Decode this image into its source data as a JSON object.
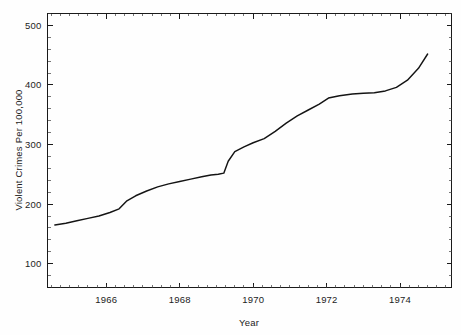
{
  "chart_data": {
    "type": "line",
    "title": "",
    "xlabel": "Year",
    "ylabel": "Violent Crimes Per 100,000",
    "xlim": [
      1964.4,
      1975.4
    ],
    "ylim": [
      60,
      520
    ],
    "grid": false,
    "legend": "none",
    "xticks": [
      1966,
      1968,
      1970,
      1972,
      1974
    ],
    "xtick_labels": [
      "1966",
      "1968",
      "1970",
      "1972",
      "1974"
    ],
    "yticks": [
      100,
      200,
      300,
      400,
      500
    ],
    "ytick_labels": [
      "100",
      "200",
      "300",
      "400",
      "500"
    ],
    "series": [
      {
        "name": "Violent Crimes Per 100,000",
        "color": "#141414",
        "x": [
          1964.6,
          1964.9,
          1965.2,
          1965.5,
          1965.8,
          1966.1,
          1966.35,
          1966.55,
          1966.8,
          1967.1,
          1967.4,
          1967.7,
          1968.0,
          1968.3,
          1968.6,
          1968.85,
          1969.05,
          1969.2,
          1969.32,
          1969.5,
          1969.75,
          1970.0,
          1970.3,
          1970.6,
          1970.9,
          1971.2,
          1971.5,
          1971.8,
          1972.05,
          1972.35,
          1972.7,
          1973.0,
          1973.3,
          1973.6,
          1973.9,
          1974.2,
          1974.5,
          1974.75
        ],
        "y": [
          165,
          168,
          172,
          176,
          180,
          186,
          192,
          205,
          214,
          222,
          229,
          234,
          238,
          242,
          246,
          249,
          250,
          252,
          272,
          288,
          296,
          303,
          310,
          322,
          336,
          348,
          358,
          368,
          378,
          382,
          385,
          386,
          387,
          390,
          396,
          408,
          428,
          452
        ]
      }
    ]
  },
  "axis_labels": {
    "y_axis_title": "Violent Crimes Per 100,000",
    "x_axis_title": "Year"
  }
}
